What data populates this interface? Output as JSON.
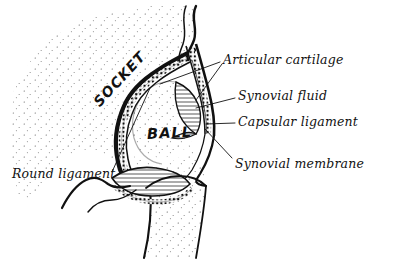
{
  "figure": {
    "style": "hand-drawn pen-and-ink anatomical illustration",
    "ink_color": "#111111",
    "background_color": "#ffffff"
  },
  "region_labels": [
    {
      "id": "socket",
      "text": "SOCKET",
      "rotation_deg": -47,
      "x": 96,
      "y": 96
    },
    {
      "id": "ball",
      "text": "BALL",
      "rotation_deg": -3,
      "x": 147,
      "y": 126
    }
  ],
  "callouts": [
    {
      "id": "articular-cartilage",
      "text": "Articular cartilage",
      "x": 223,
      "y": 52,
      "leaders": [
        {
          "x1": 220,
          "y1": 62,
          "x2": 160,
          "y2": 84
        },
        {
          "x1": 222,
          "y1": 64,
          "x2": 196,
          "y2": 100
        }
      ]
    },
    {
      "id": "synovial-fluid",
      "text": "Synovial fluid",
      "x": 238,
      "y": 88,
      "leaders": [
        {
          "x1": 235,
          "y1": 98,
          "x2": 196,
          "y2": 108
        }
      ]
    },
    {
      "id": "capsular-ligament",
      "text": "Capsular ligament",
      "x": 238,
      "y": 114,
      "leaders": [
        {
          "x1": 235,
          "y1": 123,
          "x2": 206,
          "y2": 124
        }
      ]
    },
    {
      "id": "synovial-membrane",
      "text": "Synovial membrane",
      "x": 235,
      "y": 156,
      "leaders": [
        {
          "x1": 232,
          "y1": 158,
          "x2": 205,
          "y2": 129
        }
      ]
    },
    {
      "id": "round-ligament",
      "text": "Round ligament",
      "x": 12,
      "y": 166,
      "leaders": [
        {
          "x1": 112,
          "y1": 172,
          "x2": 150,
          "y2": 88
        }
      ]
    }
  ],
  "structures": [
    {
      "id": "pelvis-bone",
      "name": "pelvic bone (ilium/acetabulum)",
      "fill": "stipple"
    },
    {
      "id": "femur-head",
      "name": "femoral head (ball)",
      "fill": "stipple"
    },
    {
      "id": "femur-shaft",
      "name": "femoral neck and shaft",
      "fill": "stipple"
    },
    {
      "id": "acetabular-cartilage",
      "name": "acetabular articular cartilage",
      "fill": "beaded"
    },
    {
      "id": "head-cartilage",
      "name": "femoral head articular cartilage",
      "fill": "beaded"
    },
    {
      "id": "synovial-cavity",
      "name": "synovial fluid cavity",
      "fill": "hatched"
    },
    {
      "id": "round-ligament-band",
      "name": "round ligament band",
      "fill": "hatched"
    },
    {
      "id": "capsule",
      "name": "capsular ligament",
      "fill": "beaded"
    }
  ]
}
